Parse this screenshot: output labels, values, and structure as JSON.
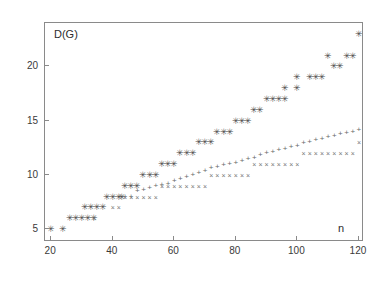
{
  "chart_data": {
    "type": "scatter",
    "title": "",
    "xlabel": "n",
    "ylabel": "D(G)",
    "xlim": [
      18,
      121
    ],
    "ylim": [
      4,
      24
    ],
    "xticks": [
      20,
      40,
      60,
      80,
      100,
      120
    ],
    "yticks": [
      5,
      10,
      15,
      20
    ],
    "grid": false,
    "legend_position": "none",
    "series": [
      {
        "name": "star-series",
        "marker": "star",
        "color": "#4a4a4a",
        "points": [
          [
            20,
            5
          ],
          [
            24,
            5
          ],
          [
            26,
            6
          ],
          [
            28,
            6
          ],
          [
            30,
            6
          ],
          [
            32,
            6
          ],
          [
            34,
            6
          ],
          [
            31,
            7
          ],
          [
            33,
            7
          ],
          [
            35,
            7
          ],
          [
            37,
            7
          ],
          [
            38,
            8
          ],
          [
            40,
            8
          ],
          [
            42,
            8
          ],
          [
            43,
            8
          ],
          [
            44,
            9
          ],
          [
            46,
            9
          ],
          [
            48,
            9
          ],
          [
            50,
            10
          ],
          [
            52,
            10
          ],
          [
            54,
            10
          ],
          [
            56,
            11
          ],
          [
            58,
            11
          ],
          [
            60,
            11
          ],
          [
            62,
            12
          ],
          [
            64,
            12
          ],
          [
            66,
            12
          ],
          [
            68,
            13
          ],
          [
            70,
            13
          ],
          [
            72,
            13
          ],
          [
            74,
            14
          ],
          [
            76,
            14
          ],
          [
            78,
            14
          ],
          [
            80,
            15
          ],
          [
            82,
            15
          ],
          [
            84,
            15
          ],
          [
            86,
            16
          ],
          [
            88,
            16
          ],
          [
            90,
            17
          ],
          [
            92,
            17
          ],
          [
            94,
            17
          ],
          [
            96,
            17
          ],
          [
            96,
            18
          ],
          [
            100,
            18
          ],
          [
            100,
            19
          ],
          [
            104,
            19
          ],
          [
            106,
            19
          ],
          [
            108,
            19
          ],
          [
            110,
            21
          ],
          [
            112,
            20
          ],
          [
            114,
            20
          ],
          [
            116,
            21
          ],
          [
            118,
            21
          ],
          [
            120,
            23
          ]
        ]
      },
      {
        "name": "plus-series",
        "marker": "plus",
        "color": "#6a6a6a",
        "points": [
          [
            44,
            8
          ],
          [
            46,
            8
          ],
          [
            48,
            8.5
          ],
          [
            50,
            8.6
          ],
          [
            52,
            8.8
          ],
          [
            54,
            9
          ],
          [
            56,
            9.1
          ],
          [
            58,
            9.2
          ],
          [
            60,
            9.4
          ],
          [
            62,
            9.6
          ],
          [
            64,
            9.8
          ],
          [
            66,
            10
          ],
          [
            68,
            10.2
          ],
          [
            70,
            10.4
          ],
          [
            72,
            10.6
          ],
          [
            74,
            10.7
          ],
          [
            76,
            10.9
          ],
          [
            78,
            11
          ],
          [
            80,
            11.1
          ],
          [
            82,
            11.3
          ],
          [
            84,
            11.5
          ],
          [
            86,
            11.6
          ],
          [
            88,
            11.8
          ],
          [
            90,
            12
          ],
          [
            92,
            12.1
          ],
          [
            94,
            12.3
          ],
          [
            96,
            12.4
          ],
          [
            98,
            12.6
          ],
          [
            100,
            12.7
          ],
          [
            102,
            12.9
          ],
          [
            104,
            13
          ],
          [
            106,
            13.2
          ],
          [
            108,
            13.3
          ],
          [
            110,
            13.5
          ],
          [
            112,
            13.6
          ],
          [
            114,
            13.8
          ],
          [
            116,
            13.9
          ],
          [
            118,
            14
          ],
          [
            120,
            14.1
          ]
        ]
      },
      {
        "name": "cross-series",
        "marker": "cross",
        "color": "#777777",
        "points": [
          [
            34,
            6
          ],
          [
            40,
            7
          ],
          [
            42,
            7
          ],
          [
            44,
            8
          ],
          [
            46,
            8
          ],
          [
            48,
            8
          ],
          [
            50,
            8
          ],
          [
            52,
            8
          ],
          [
            54,
            8
          ],
          [
            56,
            9
          ],
          [
            58,
            9
          ],
          [
            60,
            9
          ],
          [
            62,
            9
          ],
          [
            64,
            9
          ],
          [
            66,
            9
          ],
          [
            68,
            9
          ],
          [
            70,
            9
          ],
          [
            72,
            10
          ],
          [
            74,
            10
          ],
          [
            76,
            10
          ],
          [
            78,
            10
          ],
          [
            80,
            10
          ],
          [
            82,
            10
          ],
          [
            84,
            10
          ],
          [
            86,
            11
          ],
          [
            88,
            11
          ],
          [
            90,
            11
          ],
          [
            92,
            11
          ],
          [
            94,
            11
          ],
          [
            96,
            11
          ],
          [
            98,
            11
          ],
          [
            100,
            11
          ],
          [
            102,
            12
          ],
          [
            104,
            12
          ],
          [
            106,
            12
          ],
          [
            108,
            12
          ],
          [
            110,
            12
          ],
          [
            112,
            12
          ],
          [
            114,
            12
          ],
          [
            116,
            12
          ],
          [
            118,
            12
          ],
          [
            120,
            13
          ]
        ]
      }
    ]
  },
  "axes": {
    "ylabel_text": "D(G)",
    "xlabel_text": "n",
    "xtick_labels": [
      "20",
      "40",
      "60",
      "80",
      "100",
      "120"
    ],
    "ytick_labels": [
      "5",
      "10",
      "15",
      "20"
    ]
  }
}
